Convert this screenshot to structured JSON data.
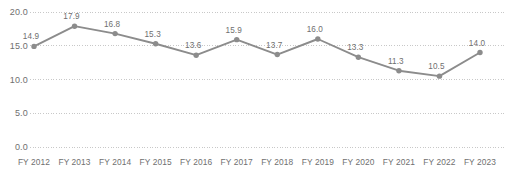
{
  "chart_data": {
    "type": "line",
    "title": "",
    "subtitle": "",
    "xlabel": "",
    "ylabel": "",
    "categories": [
      "FY 2012",
      "FY 2013",
      "FY 2014",
      "FY 2015",
      "FY 2016",
      "FY 2017",
      "FY 2018",
      "FY 2019",
      "FY 2020",
      "FY 2021",
      "FY 2022",
      "FY 2023"
    ],
    "values": [
      14.9,
      17.9,
      16.8,
      15.3,
      13.6,
      15.9,
      13.7,
      16.0,
      13.3,
      11.3,
      10.5,
      14.0
    ],
    "data_labels": [
      "14.9",
      "17.9",
      "16.8",
      "15.3",
      "13.6",
      "15.9",
      "13.7",
      "16.0",
      "13.3",
      "11.3",
      "10.5",
      "14.0"
    ],
    "ylim": [
      0.0,
      20.0
    ],
    "y_ticks": [
      0.0,
      5.0,
      10.0,
      15.0,
      20.0
    ],
    "y_tick_labels": [
      "0.0",
      "5.0",
      "10.0",
      "15.0",
      "20.0"
    ],
    "grid": true,
    "grid_style": "dotted",
    "legend": false,
    "legend_position": "none",
    "series": [
      {
        "name": "",
        "values": [
          14.9,
          17.9,
          16.8,
          15.3,
          13.6,
          15.9,
          13.7,
          16.0,
          13.3,
          11.3,
          10.5,
          14.0
        ]
      }
    ],
    "colors": {
      "line": "#8c8c8c",
      "marker": "#8c8c8c",
      "grid": "#c8c8c8",
      "text": "#6f6f6f",
      "background": "#ffffff"
    }
  }
}
